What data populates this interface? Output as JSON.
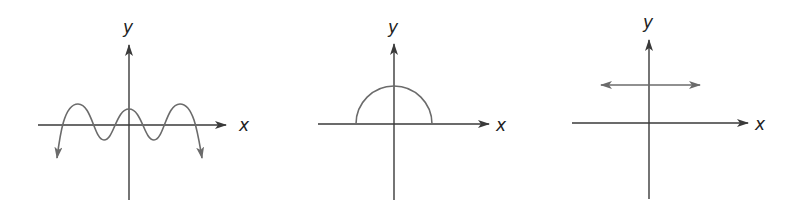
{
  "figure": {
    "graphs": [
      {
        "id": "graph-1",
        "x_axis_label": "x",
        "y_axis_label": "y",
        "curve_type": "oscillating wave with downward end arrows"
      },
      {
        "id": "graph-2",
        "x_axis_label": "x",
        "y_axis_label": "y",
        "curve_type": "upper semicircle centered at origin"
      },
      {
        "id": "graph-3",
        "x_axis_label": "x",
        "y_axis_label": "y",
        "curve_type": "horizontal line above x-axis with arrows on both ends"
      }
    ]
  },
  "colors": {
    "axis": "#3a3a3a",
    "curve": "#6b6b6b",
    "background": "#ffffff"
  }
}
